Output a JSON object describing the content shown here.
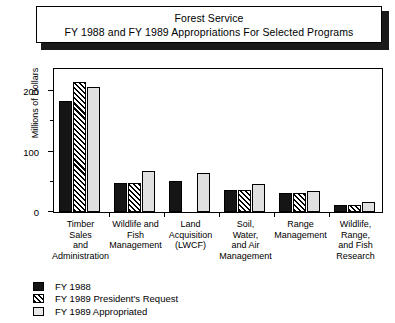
{
  "title": {
    "line1": "Forest Service",
    "line2": "FY 1988 and FY 1989 Appropriations For Selected Programs"
  },
  "chart_data": {
    "type": "bar",
    "title": "Forest Service FY 1988 and FY 1989 Appropriations For Selected Programs",
    "xlabel": "",
    "ylabel": "Millions of Dollars",
    "ylim": [
      0,
      240
    ],
    "yticks": [
      0,
      100,
      200
    ],
    "yticklabels": [
      "0",
      "100",
      "200"
    ],
    "yminorticks": [
      50,
      150
    ],
    "grid": false,
    "legend_position": "below-left",
    "categories": [
      "Timber Sales and Administration",
      "Wildlife and Fish Management",
      "Land Acquisition (LWCF)",
      "Soil, Water, and Air Management",
      "Range Management",
      "Wildlife, Range, and Fish Research"
    ],
    "category_label_lines": [
      [
        "Timber",
        "Sales",
        "and",
        "Administration"
      ],
      [
        "Wildlife and",
        "Fish",
        "Management"
      ],
      [
        "Land",
        "Acquisition",
        "(LWCF)"
      ],
      [
        "Soil,",
        "Water,",
        "and Air",
        "Management"
      ],
      [
        "Range",
        "Management"
      ],
      [
        "Wildlife,",
        "Range,",
        "and Fish",
        "Research"
      ]
    ],
    "series": [
      {
        "name": "FY 1988",
        "style": "solid-black",
        "values": [
          183,
          48,
          52,
          36,
          31,
          12
        ]
      },
      {
        "name": "FY 1989 President's Request",
        "style": "diagonal-hatch",
        "values": [
          215,
          48,
          0,
          36,
          31,
          12
        ]
      },
      {
        "name": "FY 1989 Appropriated",
        "style": "light-gray",
        "values": [
          207,
          68,
          65,
          46,
          34,
          17
        ]
      }
    ]
  },
  "legend": {
    "items": [
      {
        "label": "FY 1988"
      },
      {
        "label": "FY 1989 President's Request"
      },
      {
        "label": "FY 1989 Appropriated"
      }
    ]
  },
  "colors": {
    "series_1": "#151515",
    "series_2": "#000000",
    "series_3": "#e0e0e0",
    "frame": "#000000",
    "background": "#ffffff"
  }
}
